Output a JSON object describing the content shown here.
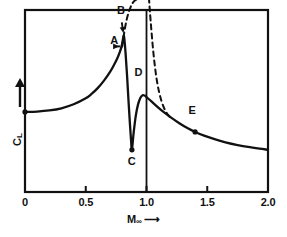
{
  "chart_data": {
    "type": "line",
    "title": "",
    "subtitle": "",
    "xlabel": "M",
    "xlabel_sub": "∞",
    "xlabel_arrow": "⟶",
    "ylabel": "C",
    "ylabel_sub": "L",
    "ylabel_arrow": "↑",
    "xlim": [
      0,
      2.0
    ],
    "ylim": [
      0,
      1.0
    ],
    "grid": false,
    "legend": "none",
    "x_ticks": [
      {
        "value": 0,
        "label": "0"
      },
      {
        "value": 0.5,
        "label": "0.5"
      },
      {
        "value": 1.0,
        "label": "1.0"
      },
      {
        "value": 1.5,
        "label": "1.5"
      },
      {
        "value": 2.0,
        "label": "2.0"
      }
    ],
    "y_ticks": [],
    "sonic_line": {
      "value": 1.0,
      "style": "solid",
      "label": ""
    },
    "series": [
      {
        "name": "Lift coefficient (actual, transonic/supersonic)",
        "style": "solid",
        "points": [
          [
            0.0,
            0.44
          ],
          [
            0.1,
            0.442
          ],
          [
            0.2,
            0.448
          ],
          [
            0.3,
            0.46
          ],
          [
            0.4,
            0.482
          ],
          [
            0.5,
            0.515
          ],
          [
            0.55,
            0.54
          ],
          [
            0.6,
            0.572
          ],
          [
            0.65,
            0.612
          ],
          [
            0.7,
            0.66
          ],
          [
            0.73,
            0.695
          ],
          [
            0.76,
            0.735
          ],
          [
            0.78,
            0.768
          ],
          [
            0.795,
            0.8
          ],
          [
            0.805,
            0.835
          ],
          [
            0.812,
            0.86
          ],
          [
            0.818,
            0.84
          ],
          [
            0.828,
            0.76
          ],
          [
            0.84,
            0.64
          ],
          [
            0.852,
            0.5
          ],
          [
            0.864,
            0.37
          ],
          [
            0.874,
            0.272
          ],
          [
            0.88,
            0.232
          ],
          [
            0.895,
            0.33
          ],
          [
            0.912,
            0.42
          ],
          [
            0.93,
            0.48
          ],
          [
            0.95,
            0.518
          ],
          [
            0.968,
            0.532
          ],
          [
            0.985,
            0.53
          ],
          [
            1.0,
            0.522
          ],
          [
            1.04,
            0.498
          ],
          [
            1.09,
            0.468
          ],
          [
            1.14,
            0.44
          ],
          [
            1.2,
            0.41
          ],
          [
            1.27,
            0.378
          ],
          [
            1.34,
            0.35
          ],
          [
            1.4,
            0.33
          ],
          [
            1.48,
            0.308
          ],
          [
            1.56,
            0.29
          ],
          [
            1.65,
            0.273
          ],
          [
            1.75,
            0.258
          ],
          [
            1.85,
            0.246
          ],
          [
            1.93,
            0.238
          ],
          [
            2.0,
            0.232
          ]
        ]
      },
      {
        "name": "Prandtl-Glauert subsonic asymptote",
        "style": "dashed",
        "points": [
          [
            0.8,
            0.8
          ],
          [
            0.812,
            0.855
          ],
          [
            0.824,
            0.905
          ],
          [
            0.838,
            0.95
          ],
          [
            0.852,
            0.985
          ],
          [
            0.866,
            1.01
          ],
          [
            0.88,
            1.032
          ],
          [
            0.9,
            1.05
          ],
          [
            0.93,
            1.062
          ],
          [
            0.96,
            1.068
          ]
        ]
      },
      {
        "name": "Supersonic linearized asymptote",
        "style": "dashed",
        "points": [
          [
            1.02,
            1.068
          ],
          [
            1.026,
            1.01
          ],
          [
            1.034,
            0.94
          ],
          [
            1.044,
            0.858
          ],
          [
            1.056,
            0.77
          ],
          [
            1.07,
            0.686
          ],
          [
            1.086,
            0.61
          ],
          [
            1.104,
            0.548
          ],
          [
            1.124,
            0.498
          ],
          [
            1.148,
            0.456
          ],
          [
            1.172,
            0.428
          ],
          [
            1.196,
            0.41
          ]
        ]
      }
    ],
    "annotations": [
      {
        "label": "A",
        "x": 0.795,
        "y": 0.8,
        "marker": false,
        "arrow": true,
        "label_x": 0.735,
        "label_y": 0.8
      },
      {
        "label": "B",
        "x": 0.812,
        "y": 0.86,
        "marker": false,
        "arrow": true,
        "label_x": 0.79,
        "label_y": 0.965
      },
      {
        "label": "C",
        "x": 0.88,
        "y": 0.232,
        "marker": true,
        "arrow": false,
        "label_x": 0.878,
        "label_y": 0.135
      },
      {
        "label": "D",
        "x": 0.968,
        "y": 0.532,
        "marker": false,
        "arrow": false,
        "label_x": 0.935,
        "label_y": 0.625
      },
      {
        "label": "E",
        "x": 1.4,
        "y": 0.33,
        "marker": true,
        "arrow": false,
        "label_x": 1.378,
        "label_y": 0.42
      },
      {
        "label": "",
        "x": 0.0,
        "y": 0.44,
        "marker": true,
        "arrow": false,
        "label_x": 0.0,
        "label_y": 0.44
      }
    ],
    "colors": {
      "line": "#111111",
      "axis": "#111111",
      "background": "#ffffff",
      "text": "#111111"
    }
  }
}
